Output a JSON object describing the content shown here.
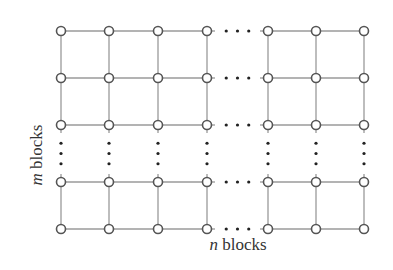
{
  "figure": {
    "type": "grid-graph",
    "labels": {
      "rows": {
        "variable": "m",
        "text": " blocks"
      },
      "columns": {
        "variable": "n",
        "text": " blocks"
      }
    },
    "columns_x": [
      61,
      109,
      158,
      207,
      268,
      316,
      364
    ],
    "rows_y": [
      31,
      78,
      125,
      182,
      229
    ],
    "horizontal_ellipsis_between_columns": [
      3,
      4
    ],
    "vertical_ellipsis_between_rows": [
      2,
      3
    ],
    "node_style": "hollow-circle",
    "node_radius": 4.5,
    "colors": {
      "edge": "#9a9a9a",
      "node_stroke": "#555555",
      "dot": "#222222",
      "text": "#333333"
    }
  }
}
